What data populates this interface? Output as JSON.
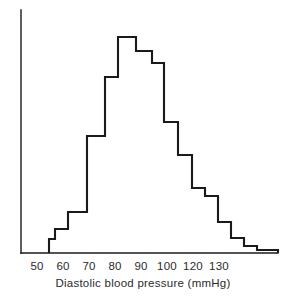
{
  "figure": {
    "width": 286,
    "height": 301,
    "background_color": "#ffffff",
    "line_color": "#1a1a1a",
    "text_color": "#2b2b2b"
  },
  "chart_data": {
    "type": "bar",
    "title": "",
    "subtitle": "",
    "xlabel": "Diastolic blood pressure (mmHg)",
    "ylabel": "",
    "grid": false,
    "legend": false,
    "legend_position": "none",
    "style": "step-outline histogram (unfilled outline, no y-axis ticks)",
    "xlim": [
      45,
      138
    ],
    "ylim": [
      0,
      100
    ],
    "xtick_labels": [
      "50",
      "60",
      "70",
      "80",
      "90",
      "100",
      "120",
      "130"
    ],
    "xtick_values": [
      50,
      60,
      70,
      80,
      90,
      100,
      110,
      120
    ],
    "xtick_pixel_centers": [
      37,
      63,
      89,
      115,
      141,
      167,
      193,
      219
    ],
    "bin_width": 5,
    "bin_edges": [
      50,
      55,
      60,
      65,
      70,
      75,
      80,
      85,
      90,
      95,
      100,
      105,
      110,
      115,
      120,
      125,
      130
    ],
    "categories": [
      "50-55",
      "55-60",
      "60-65",
      "65-70",
      "70-75",
      "75-80",
      "80-85",
      "85-90",
      "90-95",
      "95-100",
      "100-105",
      "105-110",
      "110-115",
      "115-120",
      "120-125",
      "125-130"
    ],
    "values": [
      6,
      11,
      19,
      54,
      81,
      100,
      94,
      88,
      61,
      45,
      30,
      26,
      14,
      7,
      3,
      1
    ],
    "peak_category": "80-85",
    "peak_value": 100,
    "series": [
      {
        "name": "Diastolic blood pressure frequency",
        "values": [
          6,
          11,
          19,
          54,
          81,
          100,
          94,
          88,
          61,
          45,
          30,
          26,
          14,
          7,
          3,
          1
        ]
      }
    ]
  },
  "axis_title": {
    "text": "Diastolic blood pressure (mmHg)"
  },
  "ticks": [
    {
      "label": "50",
      "x": 37
    },
    {
      "label": "60",
      "x": 63
    },
    {
      "label": "70",
      "x": 89
    },
    {
      "label": "80",
      "x": 115
    },
    {
      "label": "90",
      "x": 141
    },
    {
      "label": "100",
      "x": 167
    },
    {
      "label": "120",
      "x": 193
    },
    {
      "label": "130",
      "x": 219
    }
  ],
  "geometry": {
    "y_axis_x": 21,
    "y_axis_top": 10,
    "baseline_y": 253,
    "baseline_x_start": 21,
    "baseline_x_end": 278,
    "steps": [
      {
        "x0": 49,
        "x1": 55,
        "top_y": 239
      },
      {
        "x0": 55,
        "x1": 68,
        "top_y": 229
      },
      {
        "x0": 68,
        "x1": 87,
        "top_y": 212
      },
      {
        "x0": 87,
        "x1": 105,
        "top_y": 136
      },
      {
        "x0": 105,
        "x1": 118,
        "top_y": 77
      },
      {
        "x0": 118,
        "x1": 136,
        "top_y": 37
      },
      {
        "x0": 136,
        "x1": 152,
        "top_y": 51
      },
      {
        "x0": 152,
        "x1": 164,
        "top_y": 63
      },
      {
        "x0": 164,
        "x1": 178,
        "top_y": 122
      },
      {
        "x0": 178,
        "x1": 192,
        "top_y": 155
      },
      {
        "x0": 192,
        "x1": 205,
        "top_y": 188
      },
      {
        "x0": 205,
        "x1": 218,
        "top_y": 196
      },
      {
        "x0": 218,
        "x1": 231,
        "top_y": 222
      },
      {
        "x0": 231,
        "x1": 244,
        "top_y": 238
      },
      {
        "x0": 244,
        "x1": 257,
        "top_y": 246
      },
      {
        "x0": 257,
        "x1": 278,
        "top_y": 250
      }
    ]
  }
}
